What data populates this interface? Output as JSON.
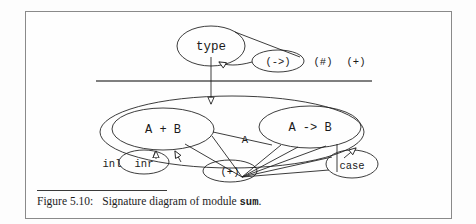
{
  "page": {
    "background_color": "#fdfdfd",
    "frame_border_color": "#8a8a8a",
    "ink_color": "#1a1a1a"
  },
  "ghost_text": {
    "line1": "scanned page bleed-through text",
    "line2": "faint reverse side characters",
    "line3": "illegible",
    "line4": "illegible",
    "line5": "faint bleed-through",
    "line6": "faint bleed-through"
  },
  "diagram": {
    "title_node": {
      "label": "type"
    },
    "top_operators": [
      {
        "name": "arrow-op",
        "label": "(->)"
      },
      {
        "name": "hash-op",
        "label": "(#)"
      },
      {
        "name": "plus-op",
        "label": "(+)"
      }
    ],
    "nodes": [
      {
        "name": "sum-type-node",
        "label": "A + B"
      },
      {
        "name": "arrow-type-node",
        "label": "A -> B"
      }
    ],
    "edge_labels": [
      {
        "name": "edge-label-a",
        "label": "A"
      }
    ],
    "operations": [
      {
        "name": "inl-op",
        "label": "inl"
      },
      {
        "name": "inr-op",
        "label": "inr"
      },
      {
        "name": "plus-constructor-op",
        "label": "(+)"
      },
      {
        "name": "case-op",
        "label": "case"
      }
    ]
  },
  "caption": {
    "label": "Figure 5.10:",
    "text_before": "Signature diagram of module",
    "module_name": "sum",
    "text_after": "."
  }
}
